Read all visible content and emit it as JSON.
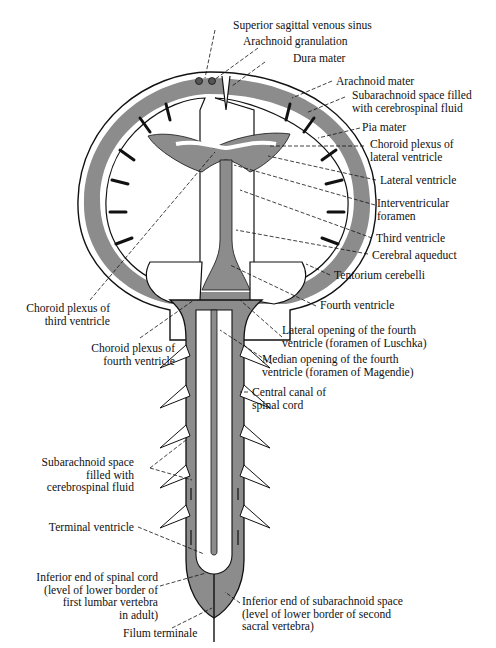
{
  "diagram": {
    "colors": {
      "csf_gray": "#8c8c8c",
      "line": "#111111",
      "background": "#ffffff"
    },
    "labels": {
      "superior_sagittal_sinus": "Superior sagittal venous sinus",
      "arachnoid_granulation": "Arachnoid granulation",
      "dura_mater": "Dura mater",
      "arachnoid_mater": "Arachnoid mater",
      "subarachnoid_space_brain_l1": "Subarachnoid space filled",
      "subarachnoid_space_brain_l2": "with  cerebrospinal fluid",
      "pia_mater": "Pia mater",
      "choroid_plexus_lateral_l1": "Choroid plexus of",
      "choroid_plexus_lateral_l2": "lateral ventricle",
      "lateral_ventricle": "Lateral ventricle",
      "interventricular_foramen_l1": "Interventricular",
      "interventricular_foramen_l2": "foramen",
      "third_ventricle": "Third ventricle",
      "cerebral_aqueduct": "Cerebral aqueduct",
      "tentorium_cerebelli": "Tentorium cerebelli",
      "fourth_ventricle": "Fourth ventricle",
      "lateral_opening_l1": "Lateral opening of the fourth",
      "lateral_opening_l2": "ventricle (foramen of Luschka)",
      "median_opening_l1": "Median opening of the fourth",
      "median_opening_l2": "ventricle (foramen of Magendie)",
      "central_canal_l1": "Central canal of",
      "central_canal_l2": "spinal cord",
      "choroid_plexus_third_l1": "Choroid plexus of",
      "choroid_plexus_third_l2": "third ventricle",
      "choroid_plexus_fourth_l1": "Choroid plexus of",
      "choroid_plexus_fourth_l2": "fourth ventricle",
      "subarachnoid_space_spinal_l1": "Subarachnoid space",
      "subarachnoid_space_spinal_l2": "filled with",
      "subarachnoid_space_spinal_l3": "cerebrospinal fluid",
      "terminal_ventricle": "Terminal ventricle",
      "inferior_end_cord_l1": "Inferior end of spinal cord",
      "inferior_end_cord_l2": "(level of  lower border of",
      "inferior_end_cord_l3": "first lumbar vertebra",
      "inferior_end_cord_l4": "in adult)",
      "filum_terminale": "Filum terminale",
      "inferior_end_subarachnoid_l1": "Inferior end of subarachnoid space",
      "inferior_end_subarachnoid_l2": "(level of lower border of second",
      "inferior_end_subarachnoid_l3": "sacral vertebra)"
    }
  }
}
